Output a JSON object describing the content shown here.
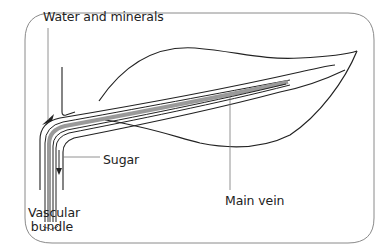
{
  "diagram": {
    "labels": {
      "water_minerals": "Water and minerals",
      "sugar": "Sugar",
      "vascular_line1": "Vascular",
      "vascular_line2": "bundle",
      "main_vein": "Main vein"
    },
    "colors": {
      "outline": "#222222",
      "frame": "#888888",
      "phloem_fill": "#9a9a9a",
      "leader": "#777777"
    },
    "arrows": [
      {
        "name": "water-up-arrow",
        "direction": "up",
        "meaning": "Water and minerals"
      },
      {
        "name": "sugar-down-arrow",
        "direction": "down",
        "meaning": "Sugar"
      }
    ]
  }
}
